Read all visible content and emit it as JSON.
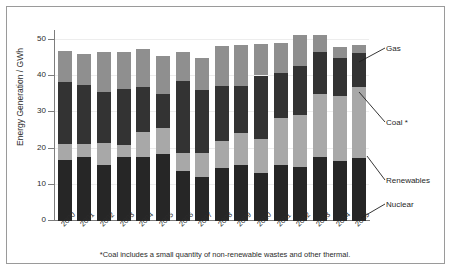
{
  "chart_data": {
    "type": "bar",
    "stacked": true,
    "title": "",
    "xlabel": "",
    "ylabel": "Energy Generation / GWh",
    "ylim": [
      0,
      55
    ],
    "yticks": [
      0,
      10,
      20,
      30,
      40,
      50
    ],
    "grid": true,
    "legend_position": "right-callouts",
    "categories": [
      "2000",
      "2001",
      "2002",
      "2003",
      "2004",
      "2005",
      "2006",
      "2007",
      "2008",
      "2009",
      "2010",
      "2011",
      "2012",
      "2013",
      "2014",
      "2015"
    ],
    "series": [
      {
        "name": "Nuclear",
        "color": "#262626",
        "values": [
          16.8,
          17.8,
          15.6,
          17.6,
          17.8,
          18.4,
          13.8,
          12.2,
          14.6,
          15.6,
          13.4,
          15.4,
          15.0,
          17.8,
          16.6,
          17.5
        ]
      },
      {
        "name": "Renewables",
        "color": "#a8a8a8",
        "values": [
          4.5,
          3.6,
          6.0,
          3.4,
          6.8,
          7.4,
          5.0,
          6.6,
          7.6,
          8.6,
          9.2,
          13.0,
          14.2,
          17.2,
          18.0,
          19.5
        ]
      },
      {
        "name": "Coal *",
        "color": "#333333",
        "values": [
          17.1,
          16.2,
          14.0,
          15.6,
          12.4,
          9.2,
          20.0,
          17.4,
          15.0,
          13.2,
          17.6,
          12.6,
          13.6,
          11.8,
          10.4,
          9.5
        ]
      },
      {
        "name": "Gas",
        "color": "#8f8f8f",
        "values": [
          8.6,
          8.6,
          11.0,
          10.0,
          10.6,
          10.6,
          7.8,
          8.8,
          11.2,
          11.2,
          8.6,
          8.2,
          8.6,
          4.6,
          3.0,
          2.0
        ]
      }
    ],
    "totals": [
      47.0,
      46.2,
      46.6,
      46.6,
      47.6,
      45.6,
      46.6,
      45.0,
      48.4,
      48.6,
      48.8,
      49.2,
      51.4,
      51.4,
      48.0,
      48.5
    ],
    "footnote": "*Coal includes a small quantity of non-renewable wastes and other thermal.",
    "legend_labels": [
      "Gas",
      "Coal *",
      "Renewables",
      "Nuclear"
    ]
  },
  "axis": {
    "y_title": "Energy Generation / GWh",
    "y_tick_labels": [
      "50",
      "40",
      "30",
      "20",
      "10",
      "0"
    ]
  },
  "legend": {
    "gas": "Gas",
    "coal": "Coal *",
    "renewables": "Renewables",
    "nuclear": "Nuclear"
  },
  "footnote": {
    "text": "*Coal includes a small quantity of non-renewable wastes and other thermal."
  }
}
